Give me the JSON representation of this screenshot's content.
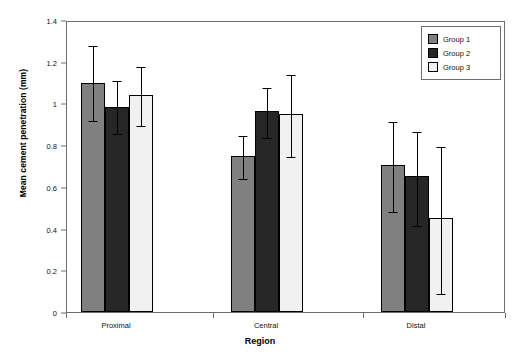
{
  "chart_data": {
    "type": "bar",
    "title": "",
    "xlabel": "Region",
    "ylabel": "Mean cement penetration (mm)",
    "categories": [
      "Proximal",
      "Central",
      "Distal"
    ],
    "ylim": [
      0,
      1.4
    ],
    "yticks": [
      "0",
      "0.2",
      "0.4",
      "0.6",
      "0.8",
      "1",
      "1.2",
      "1.4"
    ],
    "ytick_values": [
      0,
      0.2,
      0.4,
      0.6,
      0.8,
      1.0,
      1.2,
      1.4
    ],
    "grid": false,
    "legend_position": "top-right",
    "errorbars": "symmetric",
    "series": [
      {
        "name": "Group 1",
        "color": "#808080",
        "values": [
          1.1,
          0.75,
          0.705
        ],
        "err_low": [
          0.925,
          0.645,
          0.49
        ],
        "err_high": [
          1.285,
          0.855,
          0.92
        ]
      },
      {
        "name": "Group 2",
        "color": "#262626",
        "values": [
          0.985,
          0.965,
          0.65
        ],
        "err_low": [
          0.865,
          0.845,
          0.42
        ],
        "err_high": [
          1.115,
          1.085,
          0.875
        ]
      },
      {
        "name": "Group 3",
        "color": "#f1f1f1",
        "values": [
          1.04,
          0.95,
          0.45
        ],
        "err_low": [
          0.9,
          0.755,
          0.095
        ],
        "err_high": [
          1.185,
          1.145,
          0.8
        ]
      }
    ]
  },
  "legend": {
    "items": [
      {
        "label": "Group 1"
      },
      {
        "label": "Group 2"
      },
      {
        "label": "Group 3"
      }
    ]
  }
}
